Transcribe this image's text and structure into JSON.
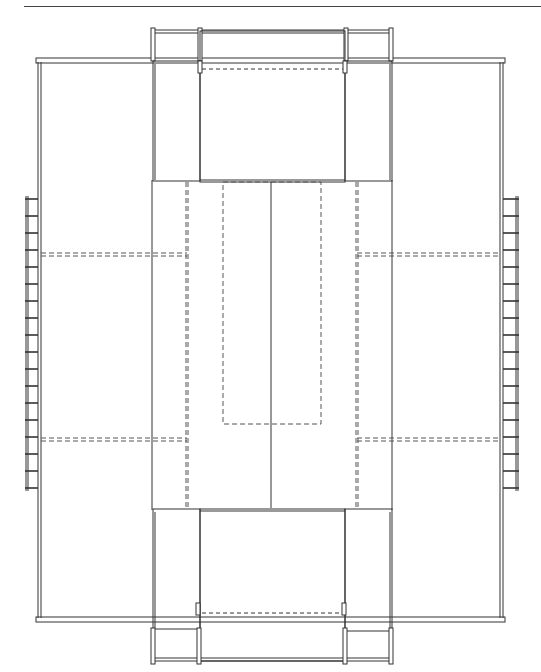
{
  "page": {
    "header_fragment": "",
    "type": "floor-plan drawing"
  },
  "drawing": {
    "stroke_color": "#333333",
    "dash_color": "#555555",
    "outer_building": {
      "x": 38,
      "y": 60,
      "w": 465,
      "h": 560
    },
    "central_bay": {
      "x": 152,
      "y": 60,
      "w": 240,
      "h": 560
    },
    "top_wing": {
      "x": 152,
      "y": 30,
      "w": 240,
      "h": 152
    },
    "bottom_wing": {
      "x": 152,
      "y": 508,
      "w": 240,
      "h": 155
    },
    "center_line_x": 271,
    "inner_dashed_rect": {
      "x": 223,
      "y": 182,
      "w": 98,
      "h": 242
    },
    "side_dashed_lines_y": [
      254,
      438
    ],
    "left_ladder": {
      "rail_x": 26,
      "y_start": 199,
      "y_end": 488,
      "rungs": 18
    },
    "right_ladder": {
      "rail_x": 516,
      "y_start": 199,
      "y_end": 488,
      "rungs": 18
    }
  }
}
